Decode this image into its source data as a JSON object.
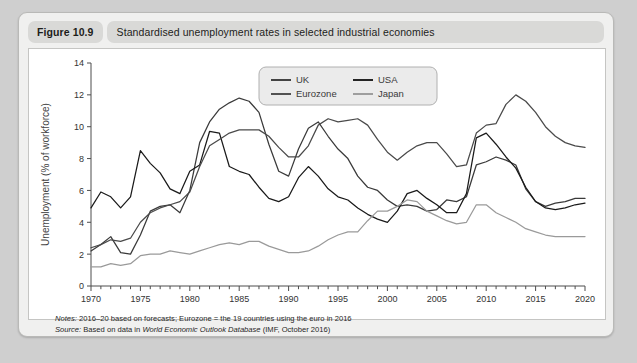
{
  "figure": {
    "number_label": "Figure 10.9",
    "title": "Standardised unemployment rates in selected industrial economies"
  },
  "footnotes": {
    "notes_lead": "Notes:",
    "notes_text": " 2016–20 based on forecasts; Eurozone = the 19 countries using the euro in 2016",
    "source_lead": "Source:",
    "source_text_pre": " Based on data in ",
    "source_italic": "World Economic Outlook Database",
    "source_text_post": " (IMF, October 2016)"
  },
  "colors": {
    "uk": "#3a3a3a",
    "usa": "#1a1a1a",
    "eurozone": "#4a4a4a",
    "japan": "#9a9a9a",
    "axis": "#4d4d4d",
    "panel_bg": "#ffffff",
    "card_bg": "#f0f0ef",
    "pill_bg": "#d9d9d7"
  },
  "chart_data": {
    "type": "line",
    "title": "Standardised unemployment rates in selected industrial economies",
    "xlabel": "",
    "ylabel": "Unemployment (% of workforce)",
    "xlim": [
      1970,
      2020
    ],
    "ylim": [
      0,
      14
    ],
    "ytick_step": 2,
    "yticks": [
      0,
      2,
      4,
      6,
      8,
      10,
      12,
      14
    ],
    "xticks": [
      1970,
      1975,
      1980,
      1985,
      1990,
      1995,
      2000,
      2005,
      2010,
      2015,
      2020
    ],
    "xtick_minor_step": 1,
    "grid": false,
    "legend_position": "top-center",
    "legend_entries": [
      "UK",
      "USA",
      "Eurozone",
      "Japan"
    ],
    "x": [
      1970,
      1971,
      1972,
      1973,
      1974,
      1975,
      1976,
      1977,
      1978,
      1979,
      1980,
      1981,
      1982,
      1983,
      1984,
      1985,
      1986,
      1987,
      1988,
      1989,
      1990,
      1991,
      1992,
      1993,
      1994,
      1995,
      1996,
      1997,
      1998,
      1999,
      2000,
      2001,
      2002,
      2003,
      2004,
      2005,
      2006,
      2007,
      2008,
      2009,
      2010,
      2011,
      2012,
      2013,
      2014,
      2015,
      2016,
      2017,
      2018,
      2019,
      2020
    ],
    "series": [
      {
        "name": "UK",
        "color": "#3a3a3a",
        "values": [
          2.2,
          2.6,
          3.1,
          2.1,
          2.0,
          3.2,
          4.7,
          5.0,
          5.1,
          4.6,
          6.0,
          9.0,
          10.3,
          11.1,
          11.5,
          11.8,
          11.6,
          10.9,
          8.9,
          7.2,
          6.9,
          8.6,
          9.9,
          10.3,
          9.4,
          8.6,
          8.0,
          6.9,
          6.2,
          6.0,
          5.4,
          5.0,
          5.1,
          5.0,
          4.7,
          4.8,
          5.4,
          5.3,
          5.6,
          7.6,
          7.8,
          8.1,
          7.9,
          7.6,
          6.1,
          5.3,
          5.0,
          5.2,
          5.3,
          5.5,
          5.5
        ]
      },
      {
        "name": "USA",
        "color": "#1a1a1a",
        "values": [
          4.9,
          5.9,
          5.6,
          4.9,
          5.6,
          8.5,
          7.7,
          7.1,
          6.1,
          5.8,
          7.2,
          7.6,
          9.7,
          9.6,
          7.5,
          7.2,
          7.0,
          6.2,
          5.5,
          5.3,
          5.6,
          6.8,
          7.5,
          6.9,
          6.1,
          5.6,
          5.4,
          4.9,
          4.5,
          4.2,
          4.0,
          4.7,
          5.8,
          6.0,
          5.5,
          5.1,
          4.6,
          4.6,
          5.8,
          9.3,
          9.6,
          8.9,
          8.1,
          7.4,
          6.2,
          5.3,
          4.9,
          4.8,
          4.9,
          5.1,
          5.2
        ]
      },
      {
        "name": "Eurozone",
        "color": "#4a4a4a",
        "values": [
          2.4,
          2.6,
          2.9,
          2.8,
          3.0,
          4.0,
          4.6,
          4.9,
          5.1,
          5.3,
          5.9,
          7.5,
          8.8,
          9.2,
          9.6,
          9.8,
          9.8,
          9.8,
          9.4,
          8.7,
          8.1,
          8.1,
          8.8,
          10.1,
          10.5,
          10.3,
          10.4,
          10.5,
          10.1,
          9.2,
          8.4,
          7.9,
          8.4,
          8.8,
          9.0,
          9.0,
          8.3,
          7.5,
          7.6,
          9.6,
          10.1,
          10.2,
          11.4,
          12.0,
          11.6,
          10.9,
          10.0,
          9.4,
          9.0,
          8.8,
          8.7
        ]
      },
      {
        "name": "Japan",
        "color": "#9a9a9a",
        "values": [
          1.2,
          1.2,
          1.4,
          1.3,
          1.4,
          1.9,
          2.0,
          2.0,
          2.2,
          2.1,
          2.0,
          2.2,
          2.4,
          2.6,
          2.7,
          2.6,
          2.8,
          2.8,
          2.5,
          2.3,
          2.1,
          2.1,
          2.2,
          2.5,
          2.9,
          3.2,
          3.4,
          3.4,
          4.1,
          4.7,
          4.7,
          5.0,
          5.4,
          5.3,
          4.7,
          4.4,
          4.1,
          3.9,
          4.0,
          5.1,
          5.1,
          4.6,
          4.3,
          4.0,
          3.6,
          3.4,
          3.2,
          3.1,
          3.1,
          3.1,
          3.1
        ]
      }
    ]
  }
}
